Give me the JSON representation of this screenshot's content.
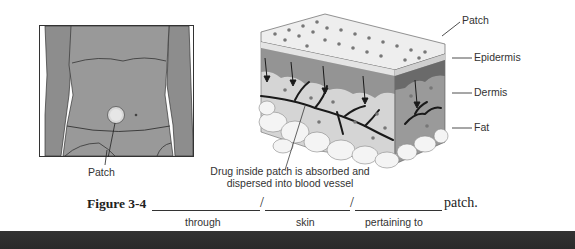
{
  "figure": {
    "number_label": "Figure 3-4",
    "torso_illustration": {
      "callout": "Patch"
    },
    "skin_diagram": {
      "layer_labels": [
        "Patch",
        "Epidermis",
        "Dermis",
        "Fat"
      ],
      "description_line1": "Drug inside patch is absorbed and",
      "description_line2": "dispersed into blood vessel"
    },
    "exercise": {
      "separators": [
        "/",
        "/"
      ],
      "ending": "patch.",
      "hints": [
        "through",
        "skin",
        "pertaining to"
      ]
    }
  },
  "colors": {
    "skin_tone": "#8f8f8f",
    "bottom_bar": "#2e2e2e"
  }
}
